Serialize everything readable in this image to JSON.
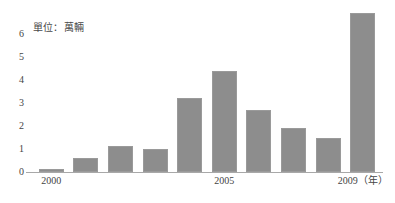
{
  "chart_data": {
    "type": "bar",
    "title": "",
    "subtitle": "",
    "unit_label": "單位：萬輛",
    "xlabel": "（年）",
    "ylabel": "",
    "categories": [
      "2000",
      "2001",
      "2002",
      "2003",
      "2004",
      "2005",
      "2006",
      "2007",
      "2008",
      "2009"
    ],
    "values": [
      0.15,
      0.6,
      1.15,
      1.0,
      3.2,
      4.4,
      2.7,
      1.9,
      1.5,
      6.9
    ],
    "series": [
      {
        "name": "年度數量",
        "values": [
          0.15,
          0.6,
          1.15,
          1.0,
          3.2,
          4.4,
          2.7,
          1.9,
          1.5,
          6.9
        ]
      }
    ],
    "ylim": [
      0,
      7.2
    ],
    "y_ticks": [
      0,
      1,
      2,
      3,
      4,
      5,
      6
    ],
    "y_tick_labels": [
      "0",
      "1",
      "2",
      "3",
      "4",
      "5",
      "6"
    ],
    "x_tick_labels": [
      "2000",
      "2005",
      "2009（年）"
    ],
    "x_tick_categories": [
      "2000",
      "2005",
      "2009"
    ],
    "grid": false,
    "legend": false,
    "legend_position": "none",
    "bar_color": "#8d8d8d",
    "bar_border_color": "#9a9a9a",
    "axis_color": "#a8a8a8",
    "text_color": "#444444",
    "background_color": "#ffffff"
  }
}
